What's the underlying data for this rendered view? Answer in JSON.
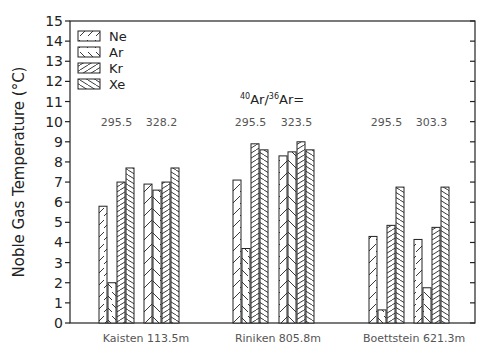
{
  "chart_data": {
    "type": "bar",
    "title": "",
    "ylabel": "Noble Gas Temperature (°C)",
    "xlabel": "",
    "ylim": [
      0,
      15
    ],
    "yticks": [
      0,
      1,
      2,
      3,
      4,
      5,
      6,
      7,
      8,
      9,
      10,
      11,
      12,
      13,
      14,
      15
    ],
    "grid": false,
    "legend_position": "top-left",
    "ratio_label": "40Ar/36Ar=",
    "series_names": [
      "Ne",
      "Ar",
      "Kr",
      "Xe"
    ],
    "locations": [
      "Kaisten 113.5m",
      "Riniken 805.8m",
      "Boettstein 621.3m"
    ],
    "groups": [
      {
        "location": "Kaisten 113.5m",
        "ratio": "295.5",
        "values": {
          "Ne": 5.8,
          "Ar": 2.0,
          "Kr": 7.0,
          "Xe": 7.7
        }
      },
      {
        "location": "Kaisten 113.5m",
        "ratio": "328.2",
        "values": {
          "Ne": 6.9,
          "Ar": 6.6,
          "Kr": 7.0,
          "Xe": 7.7
        }
      },
      {
        "location": "Riniken 805.8m",
        "ratio": "295.5",
        "values": {
          "Ne": 7.1,
          "Ar": 3.7,
          "Kr": 8.9,
          "Xe": 8.6
        }
      },
      {
        "location": "Riniken 805.8m",
        "ratio": "323.5",
        "values": {
          "Ne": 8.3,
          "Ar": 8.5,
          "Kr": 9.0,
          "Xe": 8.6
        }
      },
      {
        "location": "Boettstein 621.3m",
        "ratio": "295.5",
        "values": {
          "Ne": 4.3,
          "Ar": 0.65,
          "Kr": 4.85,
          "Xe": 6.75
        }
      },
      {
        "location": "Boettstein 621.3m",
        "ratio": "303.3",
        "values": {
          "Ne": 4.15,
          "Ar": 1.75,
          "Kr": 4.75,
          "Xe": 6.75
        }
      }
    ]
  },
  "legend": [
    {
      "name": "Ne",
      "pattern": "sparse-forward"
    },
    {
      "name": "Ar",
      "pattern": "sparse-back"
    },
    {
      "name": "Kr",
      "pattern": "dense-forward"
    },
    {
      "name": "Xe",
      "pattern": "dense-back"
    }
  ],
  "colors": {
    "line": "#222222",
    "text": "#222222",
    "annotation": "#555555",
    "background": "#ffffff"
  }
}
